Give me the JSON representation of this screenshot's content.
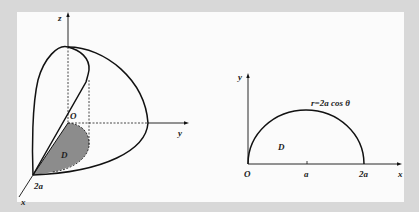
{
  "figure_3d": {
    "axis_labels": {
      "z": "z",
      "y": "y",
      "x": "x"
    },
    "origin_label": "O",
    "region_label": "D",
    "intercept_label": "2a",
    "shade_color": "#8c8c8c",
    "line_color": "#111111"
  },
  "figure_2d": {
    "axis_labels": {
      "y": "y",
      "x": "x"
    },
    "origin_label": "O",
    "tick_labels": [
      "a",
      "2a"
    ],
    "region_label": "D",
    "curve_label": "r=2a cos θ",
    "line_color": "#111111"
  },
  "colors": {
    "background": "#d8d8d8",
    "panel": "#fbfbfb"
  }
}
